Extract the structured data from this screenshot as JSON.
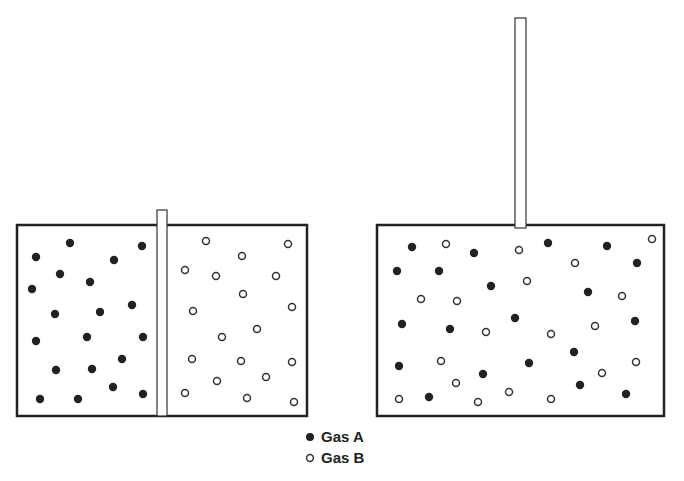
{
  "diagram": {
    "colors": {
      "gas_a": "#222222",
      "gas_b_fill": "#ffffff",
      "gas_b_stroke": "#333333",
      "outline": "#222222"
    },
    "legend": [
      {
        "marker": "filled-circle",
        "label": "Gas A"
      },
      {
        "marker": "hollow-circle",
        "label": "Gas B"
      }
    ],
    "panels": [
      {
        "name": "before-mixing",
        "partition": "inserted",
        "left_chamber": {
          "gas": "Gas A",
          "particle_count": 20
        },
        "right_chamber": {
          "gas": "Gas B",
          "particle_count": 19
        }
      },
      {
        "name": "after-mixing",
        "partition": "lifted",
        "gas_a_count": 20,
        "gas_b_count": 19
      }
    ]
  }
}
